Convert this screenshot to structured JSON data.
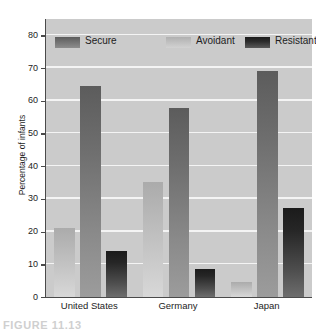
{
  "chart_data": {
    "type": "bar",
    "title": "",
    "subtitle": "",
    "xlabel": "",
    "ylabel": "Percentage of infants",
    "ylim": [
      0,
      85
    ],
    "yticks": [
      0,
      10,
      20,
      30,
      40,
      50,
      60,
      70,
      80
    ],
    "ytick_labels": [
      "0",
      "10",
      "20",
      "30",
      "40",
      "50",
      "60",
      "70",
      "80"
    ],
    "grid": true,
    "grid_color": "#f4f4f4",
    "plot_background": "#cbcbcb",
    "legend_position": "top-inside",
    "categories": [
      "United States",
      "Germany",
      "Japan"
    ],
    "bar_order": [
      "Avoidant",
      "Secure",
      "Resistant"
    ],
    "series": [
      {
        "name": "Secure",
        "color": "#6e6e6e",
        "values": [
          64.5,
          57.7,
          69.0
        ]
      },
      {
        "name": "Avoidant",
        "color": "#c2c2c2",
        "values": [
          21.2,
          35.3,
          4.5
        ]
      },
      {
        "name": "Resistant",
        "color": "#262626",
        "values": [
          14.0,
          8.6,
          27.3
        ]
      }
    ],
    "annotations": []
  },
  "legend": {
    "items": [
      {
        "label": "Secure",
        "swatch": "secure"
      },
      {
        "label": "Avoidant",
        "swatch": "avoidant"
      },
      {
        "label": "Resistant",
        "swatch": "resistant"
      }
    ]
  },
  "caption": {
    "text": "FIGURE 11.13"
  }
}
